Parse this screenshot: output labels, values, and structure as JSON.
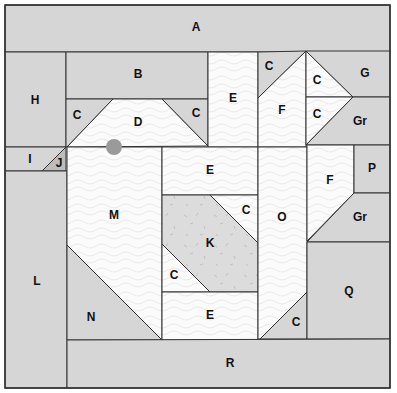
{
  "diagram": {
    "colors": {
      "gray": "#d6d6d6",
      "light": "#fbfbfb",
      "k_fill": "#dcdcdc",
      "line": "#333333",
      "dot": "#999999",
      "texture": "#e6e6e6"
    },
    "pieces": [
      {
        "id": "A",
        "label": "A",
        "fill": "gray",
        "points": "5,5 390,5 390,52 5,52",
        "lx": 196,
        "ly": 28
      },
      {
        "id": "H",
        "label": "H",
        "fill": "gray",
        "points": "5,52 66,52 66,147 5,147",
        "lx": 35,
        "ly": 101
      },
      {
        "id": "B",
        "label": "B",
        "fill": "gray",
        "points": "66,52 208,52 208,99 66,99",
        "lx": 138,
        "ly": 75
      },
      {
        "id": "C1",
        "label": "C",
        "fill": "gray",
        "points": "66,99 113,99 67,147 66,147",
        "lx": 77,
        "ly": 116
      },
      {
        "id": "D",
        "label": "D",
        "fill": "light",
        "points": "113,99 162,99 208,146 67,147",
        "lx": 138,
        "ly": 123
      },
      {
        "id": "C2",
        "label": "C",
        "fill": "gray",
        "points": "162,99 208,99 208,146",
        "lx": 196,
        "ly": 114
      },
      {
        "id": "E1",
        "label": "E",
        "fill": "light",
        "points": "208,52 258,52 258,147 208,147",
        "lx": 233,
        "ly": 99
      },
      {
        "id": "C3",
        "label": "C",
        "fill": "gray",
        "points": "258,52 306,51 258,98",
        "lx": 269,
        "ly": 67
      },
      {
        "id": "F1",
        "label": "F",
        "fill": "light",
        "points": "306,51 306,147 258,147 258,98",
        "lx": 282,
        "ly": 111
      },
      {
        "id": "C4",
        "label": "C",
        "fill": "light",
        "points": "306,51 353,97 306,97",
        "lx": 317,
        "ly": 81
      },
      {
        "id": "C5",
        "label": "C",
        "fill": "light",
        "points": "306,97 353,97 306,145",
        "lx": 317,
        "ly": 115
      },
      {
        "id": "G",
        "label": "G",
        "fill": "gray",
        "points": "306,51 390,51 390,97 353,97",
        "lx": 365,
        "ly": 74
      },
      {
        "id": "Gr1",
        "label": "Gr",
        "fill": "gray",
        "points": "353,97 390,97 390,145 306,145",
        "lx": 360,
        "ly": 122
      },
      {
        "id": "I",
        "label": "I",
        "fill": "gray",
        "points": "5,147 66,147 42,171 5,171",
        "lx": 30,
        "ly": 160
      },
      {
        "id": "J",
        "label": "J",
        "fill": "jgray",
        "points": "66,147 66,171 42,171",
        "lx": 59,
        "ly": 164
      },
      {
        "id": "L",
        "label": "L",
        "fill": "gray",
        "points": "5,171 67,171 67,388 5,388",
        "lx": 37,
        "ly": 282
      },
      {
        "id": "M",
        "label": "M",
        "fill": "light",
        "points": "67,147 162,147 162,340 67,245",
        "lx": 114,
        "ly": 216
      },
      {
        "id": "N",
        "label": "N",
        "fill": "gray",
        "points": "67,245 162,340 67,340",
        "lx": 91,
        "ly": 318
      },
      {
        "id": "E2",
        "label": "E",
        "fill": "light",
        "points": "162,147 258,147 258,195 162,195",
        "lx": 210,
        "ly": 171
      },
      {
        "id": "K",
        "label": "K",
        "fill": "k_fill",
        "points": "162,195 210,195 258,243 258,292 210,292 162,244",
        "lx": 210,
        "ly": 244
      },
      {
        "id": "C6",
        "label": "C",
        "fill": "light",
        "points": "210,195 258,195 258,243",
        "lx": 246,
        "ly": 211
      },
      {
        "id": "C7",
        "label": "C",
        "fill": "light",
        "points": "162,244 210,292 162,292",
        "lx": 174,
        "ly": 276
      },
      {
        "id": "E3",
        "label": "E",
        "fill": "light",
        "points": "162,292 258,292 258,340 162,340",
        "lx": 210,
        "ly": 316
      },
      {
        "id": "O",
        "label": "O",
        "fill": "light",
        "points": "258,147 307,147 307,292 260,339 258,339",
        "lx": 282,
        "ly": 218
      },
      {
        "id": "C8",
        "label": "C",
        "fill": "gray",
        "points": "307,292 307,339 260,339",
        "lx": 296,
        "ly": 323
      },
      {
        "id": "F2",
        "label": "F",
        "fill": "light",
        "points": "307,145 354,145 354,193 307,241",
        "lx": 330,
        "ly": 181
      },
      {
        "id": "P",
        "label": "P",
        "fill": "gray",
        "points": "354,145 390,145 390,193 354,193",
        "lx": 372,
        "ly": 169
      },
      {
        "id": "Gr2",
        "label": "Gr",
        "fill": "gray",
        "points": "354,193 390,193 390,242 307,242",
        "lx": 360,
        "ly": 218
      },
      {
        "id": "Q",
        "label": "Q",
        "fill": "gray",
        "points": "307,242 390,242 390,339 307,339",
        "lx": 349,
        "ly": 292
      },
      {
        "id": "R",
        "label": "R",
        "fill": "gray",
        "points": "67,340 390,339 390,388 67,388",
        "lx": 230,
        "ly": 364
      }
    ],
    "marker": {
      "cx": 114,
      "cy": 147,
      "r": 8
    }
  }
}
